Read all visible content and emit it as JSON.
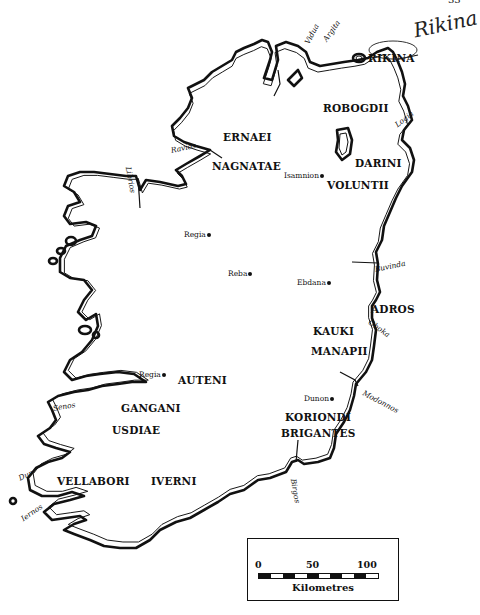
{
  "page": {
    "number": "33",
    "handwritten_note": "Rikina"
  },
  "tribes": [
    {
      "id": "robogdii",
      "label": "ROBOGDII",
      "x": 323,
      "y": 103
    },
    {
      "id": "ernaei",
      "label": "ERNAEI",
      "x": 223,
      "y": 132
    },
    {
      "id": "darini",
      "label": "DARINI",
      "x": 355,
      "y": 158
    },
    {
      "id": "nagnatae",
      "label": "NAGNATAE",
      "x": 212,
      "y": 161
    },
    {
      "id": "voluntii",
      "label": "VOLUNTII",
      "x": 327,
      "y": 180
    },
    {
      "id": "auteni",
      "label": "AUTENI",
      "x": 178,
      "y": 375
    },
    {
      "id": "kauki",
      "label": "KAUKI",
      "x": 313,
      "y": 326
    },
    {
      "id": "manapii",
      "label": "MANAPII",
      "x": 311,
      "y": 346
    },
    {
      "id": "gangani",
      "label": "GANGANI",
      "x": 121,
      "y": 403
    },
    {
      "id": "usdiae",
      "label": "USDIAE",
      "x": 112,
      "y": 425
    },
    {
      "id": "koriondi",
      "label": "KORIONDI",
      "x": 285,
      "y": 412
    },
    {
      "id": "brigantes",
      "label": "BRIGANTES",
      "x": 281,
      "y": 428
    },
    {
      "id": "vellabori",
      "label": "VELLABORI",
      "x": 57,
      "y": 476
    },
    {
      "id": "iverni",
      "label": "IVERNI",
      "x": 151,
      "y": 476
    },
    {
      "id": "adros",
      "label": "ADROS",
      "x": 371,
      "y": 304
    },
    {
      "id": "rikina",
      "label": "RIKINA",
      "x": 368,
      "y": 53
    }
  ],
  "towns": [
    {
      "id": "isamnion",
      "label": "Isamnion",
      "x": 284,
      "y": 172
    },
    {
      "id": "regia-north",
      "label": "Regia",
      "x": 184,
      "y": 231
    },
    {
      "id": "reba",
      "label": "Reba",
      "x": 228,
      "y": 270
    },
    {
      "id": "ebdana",
      "label": "Ebdana",
      "x": 297,
      "y": 279
    },
    {
      "id": "regia-south",
      "label": "Regia",
      "x": 139,
      "y": 371
    },
    {
      "id": "dunon",
      "label": "Dunon",
      "x": 304,
      "y": 395
    }
  ],
  "rivers": [
    {
      "id": "vidua",
      "label": "Vidua",
      "x": 307,
      "y": 40,
      "rotate": -62
    },
    {
      "id": "argita",
      "label": "Argita",
      "x": 325,
      "y": 37,
      "rotate": -55
    },
    {
      "id": "logia",
      "label": "Logia",
      "x": 396,
      "y": 122,
      "rotate": -38
    },
    {
      "id": "ravios",
      "label": "Ravios",
      "x": 171,
      "y": 147,
      "rotate": -12
    },
    {
      "id": "librios",
      "label": "Librios",
      "x": 128,
      "y": 163,
      "rotate": 80
    },
    {
      "id": "buvinda",
      "label": "Buvinda",
      "x": 375,
      "y": 266,
      "rotate": -12
    },
    {
      "id": "oboka",
      "label": "Oboka",
      "x": 369,
      "y": 318,
      "rotate": 35
    },
    {
      "id": "modonnos",
      "label": "Modonnos",
      "x": 363,
      "y": 389,
      "rotate": 28
    },
    {
      "id": "senos",
      "label": "Senos",
      "x": 53,
      "y": 405,
      "rotate": -10
    },
    {
      "id": "dur",
      "label": "Dur",
      "x": 19,
      "y": 475,
      "rotate": -25
    },
    {
      "id": "iernos",
      "label": "Iernos",
      "x": 22,
      "y": 516,
      "rotate": -35
    },
    {
      "id": "birgos",
      "label": "Birgos",
      "x": 293,
      "y": 475,
      "rotate": 80
    }
  ],
  "scale": {
    "ticks": [
      {
        "label": "0",
        "x": 10
      },
      {
        "label": "50",
        "x": 64
      },
      {
        "label": "100",
        "x": 118
      }
    ],
    "unit": "Kilometres",
    "max_km": 100
  },
  "colors": {
    "ink": "#111111",
    "paper": "#ffffff"
  }
}
